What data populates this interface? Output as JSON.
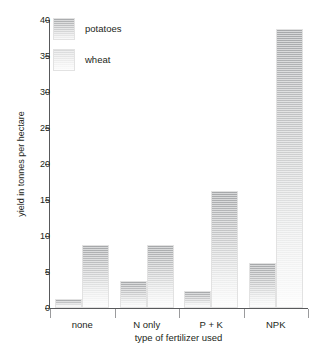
{
  "chart_data": {
    "type": "bar",
    "title": "",
    "xlabel": "type of fertilizer used",
    "ylabel": "yield in tonnes per hectare",
    "categories": [
      "none",
      "N only",
      "P + K",
      "NPK"
    ],
    "series": [
      {
        "name": "potatoes",
        "values": [
          1.3,
          3.7,
          2.4,
          6.2
        ]
      },
      {
        "name": "wheat",
        "values": [
          8.8,
          8.8,
          16.2,
          38.8
        ]
      }
    ],
    "ylim": [
      0,
      40
    ],
    "yticks": [
      0,
      5,
      10,
      15,
      20,
      25,
      30,
      35,
      40
    ],
    "grid": false,
    "legend_position": "top-left",
    "colors": {
      "potatoes": "#a6a8aa",
      "wheat": "#c9cacb",
      "axis": "#58595b",
      "text": "#231f20",
      "background": "#ffffff"
    }
  }
}
